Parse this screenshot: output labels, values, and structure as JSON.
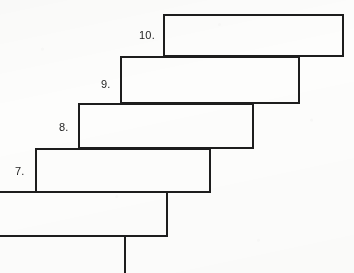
{
  "figure": {
    "name": "cascading-steps-diagram",
    "background_color": "#fdfdfc",
    "line_color": "#1d1d1d",
    "canvas": {
      "width": 354,
      "height": 273
    }
  },
  "steps": [
    {
      "id": "step-10",
      "label": "10.",
      "label_x": 139,
      "label_y": 30,
      "rect": {
        "x": 164,
        "y": 15,
        "width": 179,
        "height": 41
      }
    },
    {
      "id": "step-9",
      "label": "9.",
      "label_x": 101,
      "label_y": 79,
      "rect": {
        "x": 121,
        "y": 57,
        "width": 178,
        "height": 46
      }
    },
    {
      "id": "step-8",
      "label": "8.",
      "label_x": 59,
      "label_y": 122,
      "rect": {
        "x": 79,
        "y": 104,
        "width": 174,
        "height": 44
      }
    },
    {
      "id": "step-7",
      "label": "7.",
      "label_x": 15,
      "label_y": 166,
      "rect": {
        "x": 36,
        "y": 149,
        "width": 174,
        "height": 43
      }
    }
  ],
  "base_box": {
    "id": "base-step",
    "label": "",
    "rect": {
      "x": -10,
      "y": 192,
      "width": 177,
      "height": 44
    }
  },
  "stem": {
    "id": "vertical-stem",
    "x": 125,
    "y_top": 236,
    "y_bottom": 273
  },
  "chart_data": {
    "type": "diagram",
    "title": "",
    "shape": "cascading-staircase",
    "orientation": "ascending-right",
    "element_count": 5,
    "labels": [
      "7.",
      "8.",
      "9.",
      "10."
    ],
    "boxes": [
      {
        "label": "10.",
        "x": 164,
        "y": 15,
        "w": 179,
        "h": 41
      },
      {
        "label": "9.",
        "x": 121,
        "y": 57,
        "w": 178,
        "h": 46
      },
      {
        "label": "8.",
        "x": 79,
        "y": 104,
        "w": 174,
        "h": 44
      },
      {
        "label": "7.",
        "x": 36,
        "y": 149,
        "w": 174,
        "h": 43
      },
      {
        "label": "",
        "x": -10,
        "y": 192,
        "w": 177,
        "h": 44
      }
    ],
    "connector": {
      "type": "vertical-line",
      "x": 125,
      "from_y": 236,
      "to_y": 273
    }
  }
}
